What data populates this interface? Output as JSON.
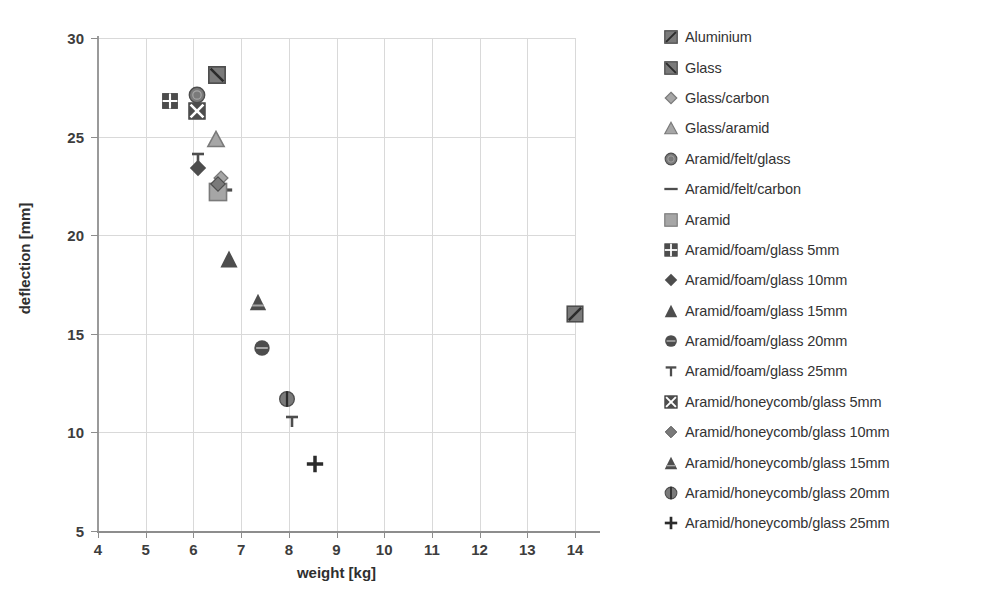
{
  "chart_data": {
    "type": "scatter",
    "title": "",
    "xlabel": "weight [kg]",
    "ylabel": "deflection [mm]",
    "xlim": [
      4,
      14
    ],
    "ylim": [
      5,
      30
    ],
    "xticks": [
      4,
      5,
      6,
      7,
      8,
      9,
      10,
      11,
      12,
      13,
      14
    ],
    "yticks": [
      5,
      10,
      15,
      20,
      25,
      30
    ],
    "grid": true,
    "legend_position": "right",
    "series": [
      {
        "name": "Aluminium",
        "marker": "square-diag",
        "x": 14.0,
        "y": 16.0
      },
      {
        "name": "Glass",
        "marker": "square-backdiag",
        "x": 6.5,
        "y": 28.1
      },
      {
        "name": "Glass/carbon",
        "marker": "diamond-open",
        "x": 6.58,
        "y": 22.9
      },
      {
        "name": "Glass/aramid",
        "marker": "triangle-open",
        "x": 6.47,
        "y": 24.9
      },
      {
        "name": "Aramid/felt/glass",
        "marker": "circle-open",
        "x": 6.08,
        "y": 27.1
      },
      {
        "name": "Aramid/felt/carbon",
        "marker": "dash",
        "x": 6.62,
        "y": 22.3
      },
      {
        "name": "Aramid",
        "marker": "square-fill",
        "x": 6.52,
        "y": 22.2
      },
      {
        "name": "Aramid/foam/glass 5mm",
        "marker": "square-plus",
        "x": 5.5,
        "y": 26.8
      },
      {
        "name": "Aramid/foam/glass 10mm",
        "marker": "diamond-fill",
        "x": 6.1,
        "y": 23.4
      },
      {
        "name": "Aramid/foam/glass 15mm",
        "marker": "triangle-fill",
        "x": 6.75,
        "y": 18.8
      },
      {
        "name": "Aramid/foam/glass 20mm",
        "marker": "circle-bar",
        "x": 7.44,
        "y": 14.3
      },
      {
        "name": "Aramid/foam/glass 25mm",
        "marker": "tee",
        "x": 6.1,
        "y": 23.9
      },
      {
        "name": "Aramid/honeycomb/glass 5mm",
        "marker": "square-x",
        "x": 6.08,
        "y": 26.3
      },
      {
        "name": "Aramid/honeycomb/glass 10mm",
        "marker": "diamond-mid",
        "x": 6.52,
        "y": 22.6
      },
      {
        "name": "Aramid/honeycomb/glass 15mm",
        "marker": "triangle-shade",
        "x": 7.35,
        "y": 16.6
      },
      {
        "name": "Aramid/honeycomb/glass 20mm",
        "marker": "circle-half",
        "x": 7.96,
        "y": 11.7
      },
      {
        "name": "Aramid/honeycomb/glass 25mm",
        "marker": "plus",
        "x": 8.54,
        "y": 8.4
      }
    ],
    "extra_points": [
      {
        "name": "Aramid/foam/glass 25mm (plot)",
        "marker": "tee",
        "x": 8.06,
        "y": 10.6
      }
    ]
  },
  "axes": {
    "x": {
      "title": "weight [kg]",
      "ticks": [
        "4",
        "5",
        "6",
        "7",
        "8",
        "9",
        "10",
        "11",
        "12",
        "13",
        "14"
      ]
    },
    "y": {
      "title": "deflection [mm]",
      "ticks": [
        "5",
        "10",
        "15",
        "20",
        "25",
        "30"
      ]
    }
  },
  "legend": {
    "items": [
      {
        "label": "Aluminium",
        "marker": "square-diag"
      },
      {
        "label": "Glass",
        "marker": "square-backdiag"
      },
      {
        "label": "Glass/carbon",
        "marker": "diamond-open"
      },
      {
        "label": "Glass/aramid",
        "marker": "triangle-open"
      },
      {
        "label": "Aramid/felt/glass",
        "marker": "circle-open"
      },
      {
        "label": "Aramid/felt/carbon",
        "marker": "dash"
      },
      {
        "label": "Aramid",
        "marker": "square-fill"
      },
      {
        "label": "Aramid/foam/glass 5mm",
        "marker": "square-plus"
      },
      {
        "label": "Aramid/foam/glass 10mm",
        "marker": "diamond-fill"
      },
      {
        "label": "Aramid/foam/glass 15mm",
        "marker": "triangle-fill"
      },
      {
        "label": "Aramid/foam/glass 20mm",
        "marker": "circle-bar"
      },
      {
        "label": "Aramid/foam/glass 25mm",
        "marker": "tee"
      },
      {
        "label": "Aramid/honeycomb/glass 5mm",
        "marker": "square-x"
      },
      {
        "label": "Aramid/honeycomb/glass 10mm",
        "marker": "diamond-mid"
      },
      {
        "label": "Aramid/honeycomb/glass 15mm",
        "marker": "triangle-shade"
      },
      {
        "label": "Aramid/honeycomb/glass 20mm",
        "marker": "circle-half"
      },
      {
        "label": "Aramid/honeycomb/glass 25mm",
        "marker": "plus"
      }
    ]
  },
  "colors": {
    "marker_dark": "#4d4d4d",
    "marker_mid": "#7a7a7a",
    "marker_light": "#a6a6a6",
    "grid": "#d9d9d9",
    "axis": "#8d8d8d",
    "text": "#333333"
  }
}
